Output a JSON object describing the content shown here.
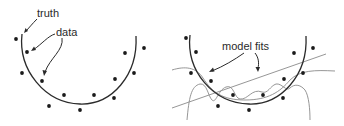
{
  "panels": [
    {
      "id": "left",
      "labels": {
        "truth": "truth",
        "data": "data"
      }
    },
    {
      "id": "right",
      "labels": {
        "model_fits": "model fits"
      }
    }
  ],
  "colors": {
    "truth_curve": "#2b2b2b",
    "data_points": "#1a1a1a",
    "model_fits": "#8a8a8a",
    "text": "#2a2a2a"
  },
  "left_points": [
    [
      16,
      39
    ],
    [
      27,
      52
    ],
    [
      22,
      73
    ],
    [
      42,
      81
    ],
    [
      64,
      95
    ],
    [
      49,
      106
    ],
    [
      80,
      110
    ],
    [
      94,
      95
    ],
    [
      114,
      98
    ],
    [
      115,
      79
    ],
    [
      125,
      53
    ],
    [
      134,
      73
    ],
    [
      144,
      48
    ]
  ],
  "right_points": [
    [
      186,
      38
    ],
    [
      196,
      52
    ],
    [
      191,
      73
    ],
    [
      211,
      81
    ],
    [
      233,
      95
    ],
    [
      218,
      106
    ],
    [
      249,
      110
    ],
    [
      263,
      95
    ],
    [
      283,
      98
    ],
    [
      284,
      79
    ],
    [
      294,
      53
    ],
    [
      303,
      73
    ],
    [
      313,
      48
    ]
  ]
}
